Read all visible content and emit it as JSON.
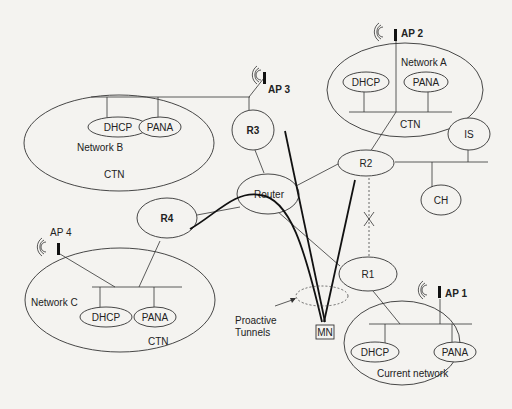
{
  "diagram": {
    "networks": [
      {
        "id": "network-a",
        "name": "Network A",
        "type": "CTN",
        "servers": [
          "DHCP",
          "PANA"
        ],
        "ap": "AP 2"
      },
      {
        "id": "network-b",
        "name": "Network B",
        "type": "CTN",
        "servers": [
          "DHCP",
          "PANA"
        ],
        "ap": "AP 3"
      },
      {
        "id": "network-c",
        "name": "Network C",
        "type": "CTN",
        "servers": [
          "DHCP",
          "PANA"
        ],
        "ap": "AP 4"
      },
      {
        "id": "current-network",
        "name": "Current network",
        "servers": [
          "DHCP",
          "PANA"
        ],
        "ap": "AP  1"
      }
    ],
    "routers": {
      "r1": "R1",
      "r2": "R2",
      "r3": "R3",
      "r4": "R4",
      "core": "Router"
    },
    "other_nodes": {
      "is": "IS",
      "ch": "CH",
      "mn": "MN"
    },
    "annotations": {
      "tunnels": [
        "Proactive",
        "Tunnels"
      ]
    }
  }
}
